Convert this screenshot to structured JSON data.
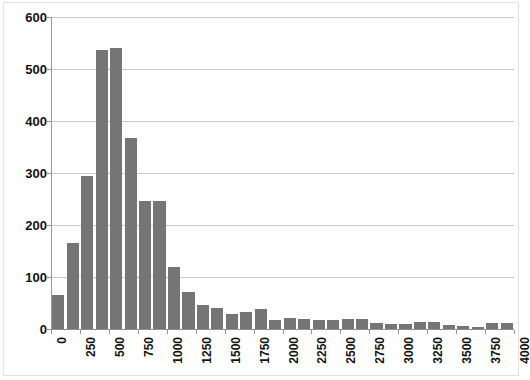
{
  "chart_data": {
    "type": "bar",
    "title": "",
    "subtitle": "",
    "xlabel": "",
    "ylabel": "",
    "grid": true,
    "legend": null,
    "bar_color": "#757575",
    "gridline_color": "#c9c9c9",
    "axis_color": "#9a9a9a",
    "xlim": [
      0,
      4000
    ],
    "ylim": [
      0,
      600
    ],
    "y_ticks": [
      0,
      100,
      200,
      300,
      400,
      500,
      600
    ],
    "y_tick_labels": [
      "0",
      "100",
      "200",
      "300",
      "400",
      "500",
      "600"
    ],
    "x_ticks": [
      0,
      250,
      500,
      750,
      1000,
      1250,
      1500,
      1750,
      2000,
      2250,
      2500,
      2750,
      3000,
      3250,
      3500,
      3750,
      4000
    ],
    "x_tick_labels": [
      "0",
      "250",
      "500",
      "750",
      "1000",
      "1250",
      "1500",
      "1750",
      "2000",
      "2250",
      "2500",
      "2750",
      "3000",
      "3250",
      "3500",
      "3750",
      "4000"
    ],
    "bin_width": 125,
    "categories": [
      "0",
      "125",
      "250",
      "375",
      "500",
      "625",
      "750",
      "875",
      "1000",
      "1125",
      "1250",
      "1375",
      "1500",
      "1625",
      "1750",
      "1875",
      "2000",
      "2125",
      "2250",
      "2375",
      "2500",
      "2625",
      "2750",
      "2875",
      "3000",
      "3125",
      "3250",
      "3375",
      "3500",
      "3625",
      "3750",
      "3875"
    ],
    "values": [
      65,
      165,
      294,
      537,
      540,
      367,
      247,
      246,
      119,
      72,
      47,
      40,
      28,
      32,
      38,
      17,
      21,
      20,
      17,
      17,
      19,
      19,
      12,
      10,
      9,
      14,
      13,
      7,
      5,
      4,
      11,
      11
    ]
  }
}
